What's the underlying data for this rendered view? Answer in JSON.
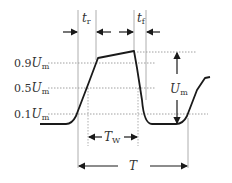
{
  "diagram": {
    "levels": {
      "l90": {
        "label": "0.9",
        "sym": "U",
        "sub": "m"
      },
      "l50": {
        "label": "0.5",
        "sym": "U",
        "sub": "m"
      },
      "l10": {
        "label": "0.1",
        "sym": "U",
        "sub": "m"
      }
    },
    "annotations": {
      "rise_time": {
        "sym": "t",
        "sub": "r"
      },
      "fall_time": {
        "sym": "t",
        "sub": "f"
      },
      "amplitude": {
        "sym": "U",
        "sub": "m"
      },
      "pulse_width": {
        "sym": "T",
        "sub": "W"
      },
      "period": {
        "sym": "T"
      }
    },
    "colors": {
      "line": "#1a1a1a",
      "guide": "#9a9a9a",
      "text": "#333333"
    }
  }
}
